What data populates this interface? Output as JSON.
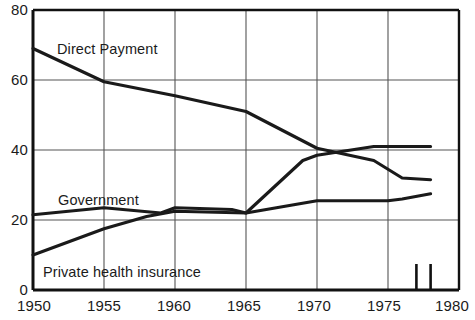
{
  "chart_data": {
    "type": "line",
    "title": "",
    "subtitle": "",
    "xlabel": "",
    "ylabel": "",
    "xlim": [
      1950,
      1980
    ],
    "ylim": [
      0,
      80
    ],
    "grid": true,
    "legend_position": "inline-annotations",
    "x_ticks": [
      "1950",
      "1955",
      "1960",
      "1965",
      "1970",
      "1975",
      "1980"
    ],
    "y_ticks": [
      "0",
      "20",
      "40",
      "60",
      "80"
    ],
    "x_tick_values": [
      1950,
      1955,
      1960,
      1965,
      1970,
      1975,
      1980
    ],
    "y_tick_values": [
      0,
      20,
      40,
      60,
      80
    ],
    "series": [
      {
        "name": "Direct Payment",
        "label": "Direct Payment",
        "color": "#1a1a1a",
        "x": [
          1950,
          1955,
          1960,
          1965,
          1970,
          1974,
          1976,
          1978
        ],
        "values": [
          69,
          59.5,
          55.5,
          51,
          40.5,
          37,
          32,
          31.5
        ]
      },
      {
        "name": "Government",
        "label": "Government",
        "color": "#1a1a1a",
        "x": [
          1950,
          1955,
          1959,
          1960,
          1964,
          1965,
          1970,
          1975,
          1976,
          1978
        ],
        "values": [
          21.5,
          23.5,
          22,
          23.5,
          23,
          22,
          25.5,
          25.5,
          26,
          27.5
        ]
      },
      {
        "name": "Private health insurance",
        "label": "Private health insurance",
        "color": "#1a1a1a",
        "x": [
          1950,
          1955,
          1958,
          1960,
          1965,
          1969,
          1970,
          1974,
          1976,
          1978
        ],
        "values": [
          10,
          17.5,
          21,
          22.5,
          22,
          37,
          38.5,
          41,
          41,
          41
        ]
      }
    ],
    "annotations": [
      {
        "name": "direct-payment-label",
        "text": "Direct Payment",
        "x": 1953.5,
        "y": 70
      },
      {
        "name": "government-label",
        "text": "Government",
        "x": 1951.5,
        "y": 29
      },
      {
        "name": "private-health-insurance-label",
        "text": "Private health insurance",
        "x": 1951.5,
        "y": 5
      }
    ],
    "axis_ticks_marks": [
      {
        "name": "minor-tick-1977",
        "x": 1977.0
      },
      {
        "name": "minor-tick-1978",
        "x": 1978.0
      }
    ]
  },
  "style": {
    "line_color": "#1a1a1a",
    "grid_color": "#555555",
    "axis_color": "#111111",
    "background": "#ffffff"
  }
}
